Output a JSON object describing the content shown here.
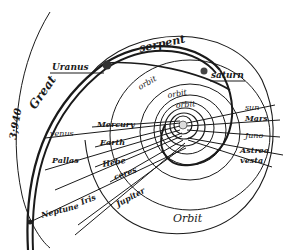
{
  "diagram": {
    "title_labels": {
      "great": "Great",
      "serpent": "serpent",
      "year": "3;940",
      "orbit_bottom": "Orbit",
      "orbit_upper": "orbit",
      "orbit_mid1": "orbit",
      "orbit_mid2": "orbit"
    },
    "bodies": {
      "uranus": "Uranus",
      "saturn": "saturn",
      "sun": "sun",
      "mars": "Mars",
      "juno": "Juno",
      "astrea": "Astrea",
      "vesta": "vesta",
      "venus": "venus",
      "mercury": "Mercury",
      "earth": "Earth",
      "pallas": "Pallas",
      "hebe": "Hebe",
      "ceres": "ceres",
      "iris": "Iris",
      "jupiter": "Jupiter",
      "neptune": "Neptune"
    },
    "colors": {
      "ink": "#1a1a1a",
      "paper": "#ffffff"
    }
  }
}
